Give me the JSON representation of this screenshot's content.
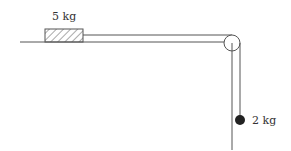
{
  "diagram": {
    "type": "physics-pulley-system",
    "block": {
      "label": "5 kg",
      "pattern": "hatched"
    },
    "hanging_mass": {
      "label": "2 kg",
      "shape": "filled-circle"
    },
    "pulley": {
      "shape": "circle"
    },
    "colors": {
      "line": "#555555",
      "mass": "#222222",
      "hatch": "#555555"
    }
  }
}
